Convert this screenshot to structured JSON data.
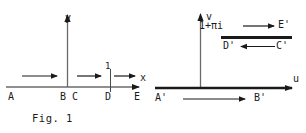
{
  "figure": {
    "caption": "Fig. 1",
    "colors": {
      "ink": "#1a1a1a",
      "axis": "#4a4a4a",
      "background": "#ffffff"
    }
  },
  "left_panel": {
    "name": "z-plane",
    "axes": {
      "vertical_label": "y",
      "horizontal_label": "x"
    },
    "points": [
      {
        "id": "A",
        "label": "A",
        "x": 10,
        "y": 96
      },
      {
        "id": "B",
        "label": "B",
        "x": 62,
        "y": 96
      },
      {
        "id": "C",
        "label": "C",
        "x": 75,
        "y": 96
      },
      {
        "id": "D",
        "label": "D",
        "x": 106,
        "y": 96
      },
      {
        "id": "E",
        "label": "E",
        "x": 137,
        "y": 96
      }
    ],
    "tick": {
      "label": "1",
      "x": 110,
      "label_x": 105,
      "label_y": 70
    },
    "direction_arrows": [
      {
        "id": "arrow-AB",
        "x1": 22,
        "x2": 60,
        "y": 76,
        "dir": "right"
      },
      {
        "id": "arrow-CD",
        "x1": 77,
        "x2": 104,
        "y": 76,
        "dir": "right"
      },
      {
        "id": "arrow-DE",
        "x1": 112,
        "x2": 138,
        "y": 76,
        "dir": "right"
      }
    ]
  },
  "right_panel": {
    "name": "w-plane",
    "axes": {
      "vertical_label": "v",
      "horizontal_label": "u"
    },
    "annotation": "1+πi",
    "points": [
      {
        "id": "E'",
        "label": "E'",
        "x": 283,
        "y": 26
      },
      {
        "id": "D'",
        "label": "D'",
        "x": 228,
        "y": 46
      },
      {
        "id": "C'",
        "label": "C'",
        "x": 281,
        "y": 46
      },
      {
        "id": "A'",
        "label": "A'",
        "x": 158,
        "y": 99
      },
      {
        "id": "B'",
        "label": "B'",
        "x": 258,
        "y": 99
      }
    ],
    "direction_arrows": [
      {
        "id": "arrow-upper-right",
        "x1": 240,
        "x2": 277,
        "y": 26,
        "dir": "right"
      },
      {
        "id": "arrow-upper-left",
        "x1": 277,
        "x2": 240,
        "y": 46,
        "dir": "left"
      },
      {
        "id": "arrow-lower-right",
        "x1": 182,
        "x2": 248,
        "y": 99,
        "dir": "right"
      }
    ]
  }
}
